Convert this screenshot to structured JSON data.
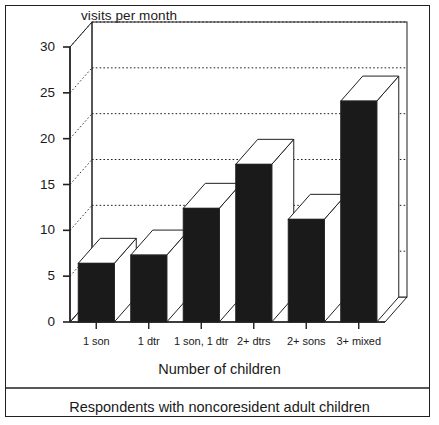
{
  "figure": {
    "caption": "Respondents with noncoresident adult children",
    "background_color": "#ffffff",
    "frame_color": "#231f20"
  },
  "chart_data": {
    "type": "bar",
    "style": "3d-column",
    "title": "",
    "ylabel": "visits per month",
    "xlabel": "Number of children",
    "ylim": [
      0,
      30
    ],
    "yticks": [
      0,
      5,
      10,
      15,
      20,
      25,
      30
    ],
    "ytick_labels": [
      "0",
      "5",
      "10",
      "15",
      "20",
      "25",
      "30"
    ],
    "grid": "horizontal-dotted",
    "legend": "none",
    "categories": [
      "1 son",
      "1 dtr",
      "1 son, 1 dtr",
      "2+ dtrs",
      "2+ sons",
      "3+ mixed"
    ],
    "values": [
      6.4,
      7.3,
      12.4,
      17.2,
      11.2,
      24.1
    ],
    "bar_face_color": "#1a1a1a",
    "bar_top_color": "#ffffff",
    "bar_side_color": "#ffffff",
    "bar_edge_color": "#231f20"
  }
}
